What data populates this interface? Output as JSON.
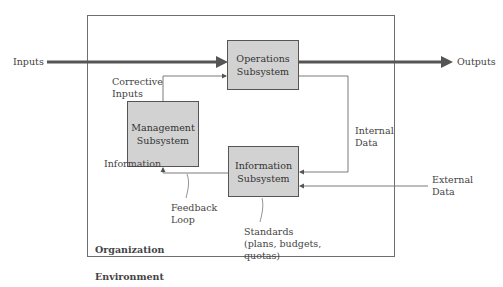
{
  "diagram": {
    "organization_label": "Organization",
    "environment_label": "Environment",
    "nodes": {
      "operations": [
        "Operations",
        "Subsystem"
      ],
      "management": [
        "Management",
        "Subsystem"
      ],
      "information": [
        "Information",
        "Subsystem"
      ]
    },
    "labels": {
      "inputs": "Inputs",
      "outputs": "Outputs",
      "corrective_inputs": [
        "Corrective",
        "Inputs"
      ],
      "information": "Information",
      "internal_data": [
        "Internal",
        "Data"
      ],
      "external_data": [
        "External",
        "Data"
      ],
      "feedback_loop": [
        "Feedback",
        "Loop"
      ],
      "standards": [
        "Standards",
        "(plans, budgets,",
        "quotas)"
      ]
    },
    "colors": {
      "box_fill": "#d2d2d2",
      "main_flow": "#555555",
      "line": "#7a7a7a"
    }
  }
}
